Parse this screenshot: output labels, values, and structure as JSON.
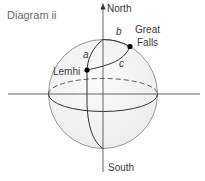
{
  "diagram": {
    "title": "Diagram ii",
    "axes": {
      "north_label": "North",
      "south_label": "South"
    },
    "points": [
      {
        "name": "Lemhi",
        "label": "Lemhi"
      },
      {
        "name": "Great Falls",
        "label_line1": "Great",
        "label_line2": "Falls"
      }
    ],
    "arcs": {
      "a": "a",
      "b": "b",
      "c": "c"
    },
    "colors": {
      "sphere_fill": "#f3f3f3",
      "sphere_outline": "#8a8a8a",
      "lines": "#333333",
      "axis": "#555555",
      "title": "#6a6a6a",
      "point": "#000000"
    }
  }
}
